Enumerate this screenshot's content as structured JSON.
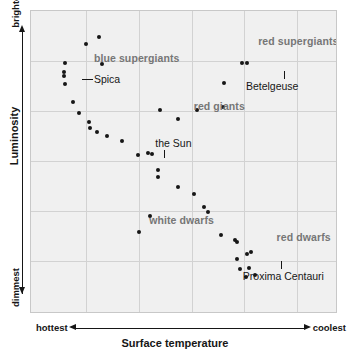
{
  "chart_data": {
    "type": "scatter",
    "title": "",
    "xlabel": "Surface temperature",
    "ylabel": "Luminosity",
    "x_axis_left_label": "hottest",
    "x_axis_right_label": "coolest",
    "y_axis_top_label": "brightest",
    "y_axis_bottom_label": "dimmest",
    "grid": true,
    "x_gridlines_pct": [
      17.9,
      35.1,
      52.3,
      69.4,
      86.6
    ],
    "y_gridlines_pct": [
      16.5,
      33.0,
      49.5,
      66.0,
      82.5
    ],
    "xlim": [
      0,
      100
    ],
    "ylim": [
      0,
      100
    ],
    "axis_note": "Temperature decreases left to right; luminosity increases bottom to top. Axes are qualitative (no numeric ticks).",
    "regions": [
      {
        "name": "blue-supergiants",
        "label": "blue supergiants",
        "x_pct": 20.5,
        "y_pct": 13.5
      },
      {
        "name": "red-supergiants",
        "label": "red supergiants",
        "x_pct": 74.0,
        "y_pct": 8.0
      },
      {
        "name": "red-giants",
        "label": "red giants",
        "x_pct": 53.0,
        "y_pct": 29.5
      },
      {
        "name": "white-dwarfs",
        "label": "white dwarfs",
        "x_pct": 38.5,
        "y_pct": 67.0
      },
      {
        "name": "red-dwarfs",
        "label": "red dwarfs",
        "x_pct": 80.0,
        "y_pct": 72.5
      }
    ],
    "named_stars": [
      {
        "name": "spica",
        "label": "Spica",
        "label_x_pct": 20.5,
        "label_y_pct": 20.5,
        "leader": "horizontal-left"
      },
      {
        "name": "betelgeuse",
        "label": "Betelgeuse",
        "label_x_pct": 70.0,
        "label_y_pct": 22.8,
        "leader": "vertical-up"
      },
      {
        "name": "the-sun",
        "label": "the Sun",
        "label_x_pct": 40.5,
        "label_y_pct": 41.5,
        "leader": "vertical-down"
      },
      {
        "name": "proxima-centauri",
        "label": "Proxima Centauri",
        "label_x_pct": 69.0,
        "label_y_pct": 85.5,
        "leader": "vertical-up"
      }
    ],
    "points": [
      {
        "x_pct": 22.0,
        "y_pct": 8.6
      },
      {
        "x_pct": 17.8,
        "y_pct": 10.8
      },
      {
        "x_pct": 23.0,
        "y_pct": 17.5
      },
      {
        "x_pct": 11.0,
        "y_pct": 17.3
      },
      {
        "x_pct": 10.8,
        "y_pct": 20.2
      },
      {
        "x_pct": 10.8,
        "y_pct": 21.6
      },
      {
        "x_pct": 11.0,
        "y_pct": 24.0
      },
      {
        "x_pct": 13.8,
        "y_pct": 30.0
      },
      {
        "x_pct": 15.6,
        "y_pct": 33.7
      },
      {
        "x_pct": 19.0,
        "y_pct": 36.5
      },
      {
        "x_pct": 19.2,
        "y_pct": 38.5
      },
      {
        "x_pct": 21.5,
        "y_pct": 40.0
      },
      {
        "x_pct": 24.9,
        "y_pct": 41.4
      },
      {
        "x_pct": 29.6,
        "y_pct": 43.0
      },
      {
        "x_pct": 35.0,
        "y_pct": 47.6
      },
      {
        "x_pct": 38.0,
        "y_pct": 47.0
      },
      {
        "x_pct": 39.4,
        "y_pct": 47.2
      },
      {
        "x_pct": 41.5,
        "y_pct": 52.6
      },
      {
        "x_pct": 41.5,
        "y_pct": 54.8
      },
      {
        "x_pct": 47.8,
        "y_pct": 58.0
      },
      {
        "x_pct": 53.2,
        "y_pct": 60.4
      },
      {
        "x_pct": 56.5,
        "y_pct": 64.6
      },
      {
        "x_pct": 57.7,
        "y_pct": 66.4
      },
      {
        "x_pct": 62.0,
        "y_pct": 74.0
      },
      {
        "x_pct": 66.5,
        "y_pct": 75.5
      },
      {
        "x_pct": 67.0,
        "y_pct": 76.2
      },
      {
        "x_pct": 67.2,
        "y_pct": 81.8
      },
      {
        "x_pct": 70.5,
        "y_pct": 80.3
      },
      {
        "x_pct": 71.8,
        "y_pct": 79.7
      },
      {
        "x_pct": 68.0,
        "y_pct": 85.0
      },
      {
        "x_pct": 71.0,
        "y_pct": 84.8
      },
      {
        "x_pct": 70.0,
        "y_pct": 87.7
      },
      {
        "x_pct": 73.0,
        "y_pct": 87.2
      },
      {
        "x_pct": 38.8,
        "y_pct": 67.5
      },
      {
        "x_pct": 35.2,
        "y_pct": 73.0
      },
      {
        "x_pct": 42.0,
        "y_pct": 32.6
      },
      {
        "x_pct": 47.8,
        "y_pct": 35.8
      },
      {
        "x_pct": 54.0,
        "y_pct": 32.6
      },
      {
        "x_pct": 62.5,
        "y_pct": 31.6
      },
      {
        "x_pct": 68.7,
        "y_pct": 17.1
      },
      {
        "x_pct": 70.3,
        "y_pct": 17.0
      },
      {
        "x_pct": 63.0,
        "y_pct": 23.8
      }
    ]
  }
}
